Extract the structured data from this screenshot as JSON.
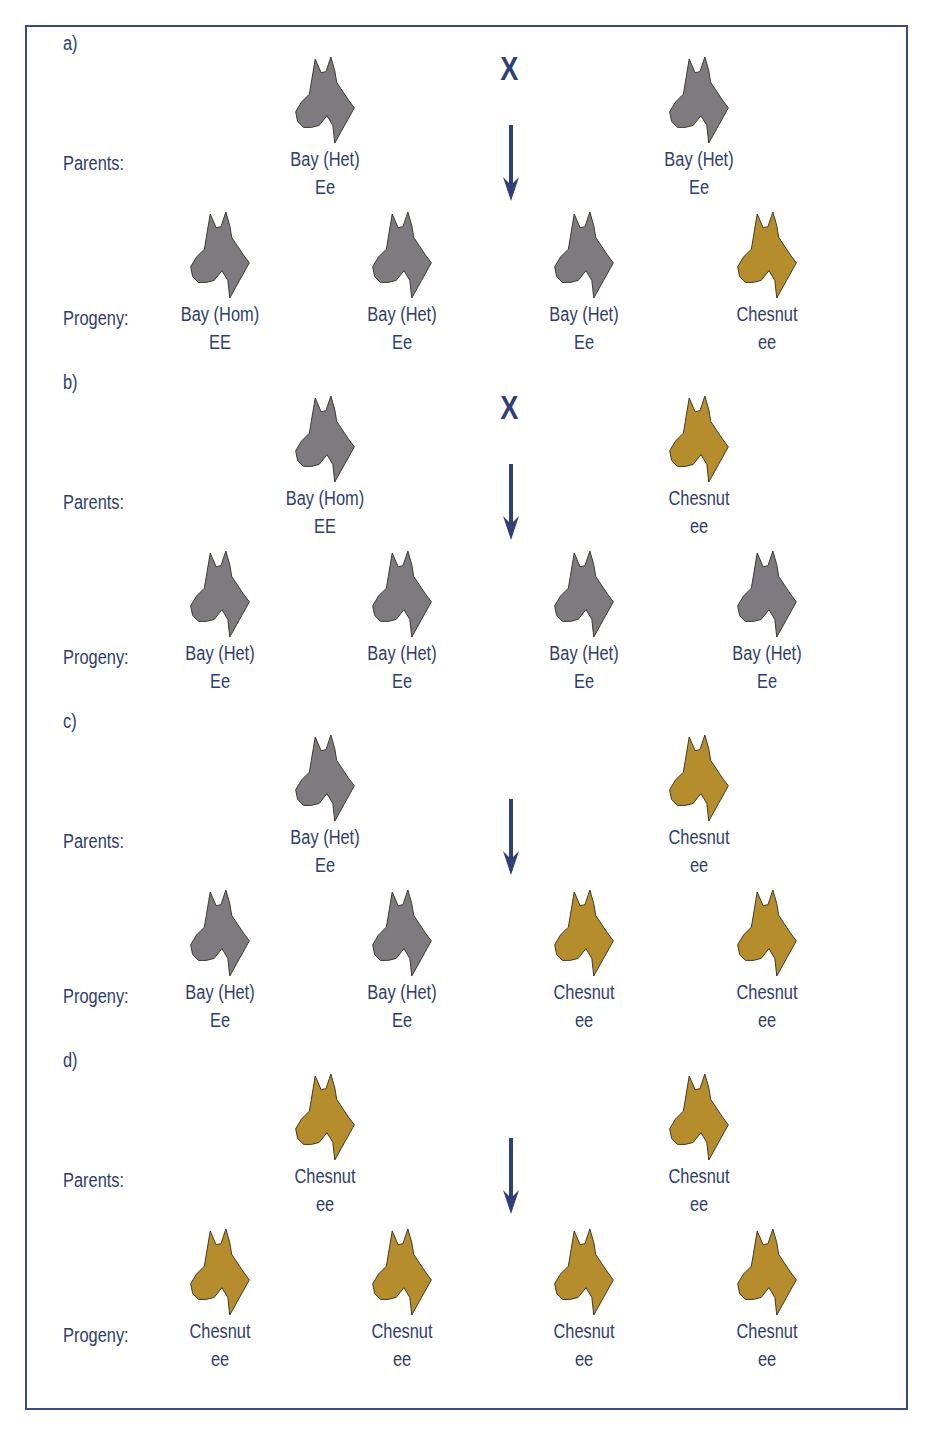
{
  "colors": {
    "frame": "#3c4a7e",
    "text": "#2f3d6b",
    "arrow": "#2f3f78",
    "bay": "#7e7b80",
    "chestnut": "#b58d2c",
    "outline": "#3d3526"
  },
  "icons": {
    "horse": "horse-head-icon",
    "arrow": "arrow-down-icon",
    "cross": "cross-symbol"
  },
  "labels": {
    "parents": "Parents:",
    "progeny": "Progeny:",
    "cross": "X"
  },
  "sections": [
    {
      "label": "a)",
      "show_cross": true,
      "parents": [
        {
          "name": "Bay  (Het)",
          "genotype": "Ee",
          "color": "bay"
        },
        {
          "name": "Bay  (Het)",
          "genotype": "Ee",
          "color": "bay"
        }
      ],
      "progeny": [
        {
          "name": "Bay  (Hom)",
          "genotype": "EE",
          "color": "bay"
        },
        {
          "name": "Bay  (Het)",
          "genotype": "Ee",
          "color": "bay"
        },
        {
          "name": "Bay  (Het)",
          "genotype": "Ee",
          "color": "bay"
        },
        {
          "name": "Chesnut",
          "genotype": "ee",
          "color": "chestnut"
        }
      ]
    },
    {
      "label": "b)",
      "show_cross": true,
      "parents": [
        {
          "name": "Bay  (Hom)",
          "genotype": "EE",
          "color": "bay"
        },
        {
          "name": "Chesnut",
          "genotype": "ee",
          "color": "chestnut"
        }
      ],
      "progeny": [
        {
          "name": "Bay  (Het)",
          "genotype": "Ee",
          "color": "bay"
        },
        {
          "name": "Bay  (Het)",
          "genotype": "Ee",
          "color": "bay"
        },
        {
          "name": "Bay  (Het)",
          "genotype": "Ee",
          "color": "bay"
        },
        {
          "name": "Bay  (Het)",
          "genotype": "Ee",
          "color": "bay"
        }
      ]
    },
    {
      "label": "c)",
      "show_cross": false,
      "parents": [
        {
          "name": "Bay  (Het)",
          "genotype": "Ee",
          "color": "bay"
        },
        {
          "name": "Chesnut",
          "genotype": "ee",
          "color": "chestnut"
        }
      ],
      "progeny": [
        {
          "name": "Bay  (Het)",
          "genotype": "Ee",
          "color": "bay"
        },
        {
          "name": "Bay  (Het)",
          "genotype": "Ee",
          "color": "bay"
        },
        {
          "name": "Chesnut",
          "genotype": "ee",
          "color": "chestnut"
        },
        {
          "name": "Chesnut",
          "genotype": "ee",
          "color": "chestnut"
        }
      ]
    },
    {
      "label": "d)",
      "show_cross": false,
      "parents": [
        {
          "name": "Chesnut",
          "genotype": "ee",
          "color": "chestnut"
        },
        {
          "name": "Chesnut",
          "genotype": "ee",
          "color": "chestnut"
        }
      ],
      "progeny": [
        {
          "name": "Chesnut",
          "genotype": "ee",
          "color": "chestnut"
        },
        {
          "name": "Chesnut",
          "genotype": "ee",
          "color": "chestnut"
        },
        {
          "name": "Chesnut",
          "genotype": "ee",
          "color": "chestnut"
        },
        {
          "name": "Chesnut",
          "genotype": "ee",
          "color": "chestnut"
        }
      ]
    }
  ]
}
